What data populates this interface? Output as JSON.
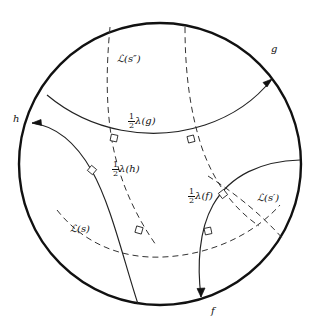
{
  "figure": {
    "model": "Poincare disk",
    "boundary": {
      "name": "unit-circle",
      "center": [
        160,
        164
      ],
      "radius": 141,
      "stroke": "#111111",
      "stroke_width": 2.4
    },
    "colors": {
      "ink": "#111111",
      "solid_stroke": "#222222",
      "dashed_stroke": "#333333",
      "background": "#ffffff"
    },
    "solid_geodesics": [
      {
        "id": "half-lambda-g",
        "label": "λ(g)",
        "label_prefix": "1/2",
        "endpoint_label": "g"
      },
      {
        "id": "half-lambda-h",
        "label": "λ(h)",
        "label_prefix": "1/2",
        "endpoint_label": "h"
      },
      {
        "id": "half-lambda-f",
        "label": "λ(f)",
        "label_prefix": "1/2",
        "endpoint_label": "f"
      }
    ],
    "dashed_geodesics": [
      {
        "id": "script-L-s-double-prime",
        "label": "ℒ(s″)"
      },
      {
        "id": "script-L-s",
        "label": "ℒ(s)"
      },
      {
        "id": "script-L-s-prime",
        "label": "ℒ(s′)"
      }
    ],
    "right_angle_marks": 6
  },
  "labels": {
    "half_numerator": "1",
    "half_denominator": "2",
    "lambda_g": "λ(g)",
    "lambda_h": "λ(h)",
    "lambda_f": "λ(f)",
    "script_L_s_double_prime": "ℒ(s″)",
    "script_L_s": "ℒ(s)",
    "script_L_s_prime": "ℒ(s′)",
    "point_g": "g",
    "point_h": "h",
    "point_f": "f"
  }
}
